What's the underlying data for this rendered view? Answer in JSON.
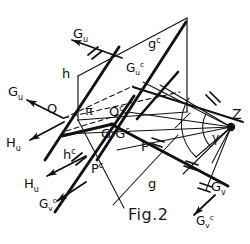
{
  "figure": {
    "caption": "Fig.2",
    "type": "descriptive-geometry-diagram"
  },
  "labels": {
    "g_u_top": "G",
    "g_u_top_sub": "u",
    "g_u_left": "G",
    "g_u_left_sub": "u",
    "h_u_upper": "H",
    "h_u_upper_sub": "u",
    "h_u_lower": "H",
    "h_u_lower_sub": "u",
    "q": "Q",
    "q_c": "Q",
    "q_c_sup": "c",
    "pi": "π",
    "h": "h",
    "h_c": "h",
    "h_c_sup": "c",
    "g": "g",
    "g_c": "g",
    "g_c_sup": "c",
    "gu_c": "G",
    "gu_c_sub": "u",
    "gu_c_sup": "c",
    "gv_c_left": "G",
    "gv_c_left_sub": "v",
    "gv_c_left_sup": "c",
    "gv_c_right": "G",
    "gv_c_right_sub": "v",
    "gv_c_right_sup": "c",
    "g_v": "G",
    "g_v_sub": "v",
    "g_gc": "G·G",
    "g_gc_sup": "c",
    "p": "P",
    "p_c": "P",
    "p_c_sup": "c",
    "z": "Z",
    "gamma": "γ"
  },
  "colors": {
    "stroke": "#111111",
    "background": "#ffffff",
    "caption": "#1a1a1a"
  }
}
